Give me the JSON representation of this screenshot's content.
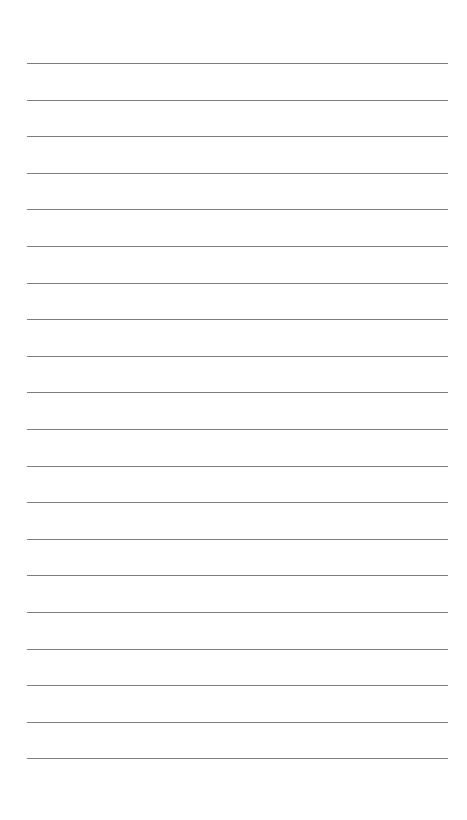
{
  "page": {
    "type": "lined-notepaper",
    "background_color": "#ffffff",
    "line_color": "#6f6f6f",
    "line_count": 20,
    "first_line_y": 63,
    "line_spacing": 36.6,
    "line_left": 27,
    "line_right": 448
  }
}
